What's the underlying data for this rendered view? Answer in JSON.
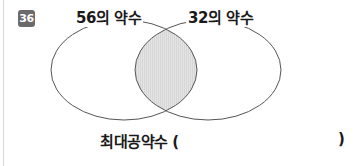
{
  "problem": {
    "number": "36",
    "badge_color": "#6b6b6b"
  },
  "venn": {
    "left_set_label": "56의 약수",
    "right_set_label": "32의 약수",
    "intersection_fill": "#e2e2e2",
    "stroke_color": "#555555"
  },
  "answer": {
    "label": "최대공약수 (",
    "close_paren": ")",
    "value": ""
  }
}
